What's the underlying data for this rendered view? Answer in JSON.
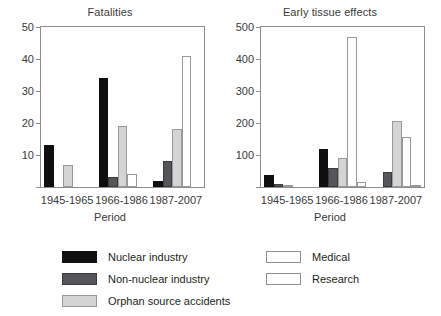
{
  "chart_data": [
    {
      "type": "bar",
      "title": "Fatalities",
      "xlabel": "Period",
      "ylabel": "",
      "categories": [
        "1945-1965",
        "1966-1986",
        "1987-2007"
      ],
      "ylim": [
        0,
        50
      ],
      "yticks": [
        0,
        10,
        20,
        30,
        40,
        50
      ],
      "ytick_labels": [
        "",
        "10",
        "20",
        "30",
        "40",
        "50"
      ],
      "grid": false,
      "legend_position": "bottom",
      "series": [
        {
          "name": "Nuclear industry",
          "color": "#100f0f",
          "values": [
            13,
            34,
            2
          ]
        },
        {
          "name": "Non-nuclear industry",
          "color": "#56565a",
          "values": [
            0,
            3,
            8
          ]
        },
        {
          "name": "Orphan source accidents",
          "color": "#d4d4d4",
          "values": [
            7,
            19,
            18
          ]
        },
        {
          "name": "Medical",
          "color": "#ffffff",
          "values": [
            0,
            4,
            41
          ]
        },
        {
          "name": "Research",
          "color": "#ffffff",
          "values": [
            0,
            0,
            0
          ]
        }
      ]
    },
    {
      "type": "bar",
      "title": "Early tissue effects",
      "xlabel": "Period",
      "ylabel": "",
      "categories": [
        "1945-1965",
        "1966-1986",
        "1987-2007"
      ],
      "ylim": [
        0,
        500
      ],
      "yticks": [
        0,
        100,
        200,
        300,
        400,
        500
      ],
      "ytick_labels": [
        "",
        "100",
        "200",
        "300",
        "400",
        "500"
      ],
      "grid": false,
      "legend_position": "bottom",
      "series": [
        {
          "name": "Nuclear industry",
          "color": "#100f0f",
          "values": [
            37,
            120,
            0
          ]
        },
        {
          "name": "Non-nuclear industry",
          "color": "#56565a",
          "values": [
            8,
            58,
            48
          ]
        },
        {
          "name": "Orphan source accidents",
          "color": "#d4d4d4",
          "values": [
            4,
            92,
            207
          ]
        },
        {
          "name": "Medical",
          "color": "#ffffff",
          "values": [
            0,
            468,
            155
          ]
        },
        {
          "name": "Research",
          "color": "#ffffff",
          "values": [
            0,
            17,
            7
          ]
        }
      ]
    }
  ],
  "legend": {
    "column_a": [
      {
        "label": "Nuclear industry",
        "swatch": "black"
      },
      {
        "label": "Non-nuclear industry",
        "swatch": "dgray"
      },
      {
        "label": "Orphan source accidents",
        "swatch": "lgray"
      }
    ],
    "column_b": [
      {
        "label": "Medical",
        "swatch": "white"
      },
      {
        "label": "Research",
        "swatch": "white"
      }
    ]
  }
}
